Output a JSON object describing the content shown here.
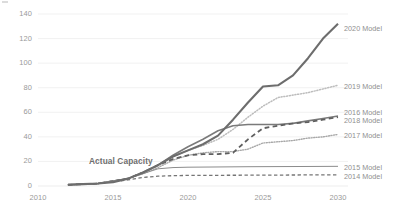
{
  "chart_data": {
    "type": "line",
    "title": "",
    "subtitle": "",
    "xlabel": "",
    "ylabel": "",
    "xlim": [
      2010,
      2030
    ],
    "ylim": [
      0,
      140
    ],
    "grid": true,
    "grid_orientation": "horizontal",
    "legend_position": "right-inline-end-of-line",
    "x_ticks": [
      "2010",
      "2015",
      "2020",
      "2025",
      "2030"
    ],
    "y_ticks": [
      "0",
      "20",
      "40",
      "60",
      "80",
      "100",
      "120",
      "140"
    ],
    "annotations": [
      {
        "text": "Actual Capacity",
        "x": 2015.6,
        "y": 20,
        "bold": true
      }
    ],
    "series": [
      {
        "name": "2020 Model",
        "label": "2020 Model",
        "color": "#6d6d6d",
        "style": "solid",
        "width": 2.1,
        "legend_y_value": 128,
        "x": [
          2012,
          2013,
          2014,
          2015,
          2016,
          2017,
          2018,
          2019,
          2020,
          2021,
          2022,
          2023,
          2024,
          2025,
          2026,
          2027,
          2028,
          2029,
          2030
        ],
        "values": [
          1,
          1.5,
          2,
          3,
          6,
          11,
          17,
          24,
          29,
          34,
          41,
          54,
          68,
          81,
          82,
          90,
          104,
          120,
          132
        ]
      },
      {
        "name": "2019 Model",
        "label": "2019 Model",
        "color": "#bdbdbd",
        "style": "dotted",
        "width": 1.5,
        "legend_y_value": 81,
        "x": [
          2012,
          2014,
          2016,
          2017,
          2018,
          2019,
          2020,
          2021,
          2022,
          2023,
          2024,
          2025,
          2026,
          2027,
          2028,
          2029,
          2030
        ],
        "values": [
          1,
          2,
          6,
          11,
          17,
          24,
          29,
          33,
          38,
          46,
          56,
          65,
          72,
          74,
          76,
          79,
          82
        ]
      },
      {
        "name": "2016 Model",
        "label": "2016 Model",
        "color": "#7a7a7a",
        "style": "solid",
        "width": 1.6,
        "legend_y_value": 60,
        "x": [
          2012,
          2014,
          2016,
          2017,
          2018,
          2019,
          2020,
          2021,
          2022,
          2023,
          2024,
          2025,
          2026,
          2027,
          2028,
          2029,
          2030
        ],
        "values": [
          1,
          2,
          6,
          11,
          17,
          25,
          32,
          38,
          45,
          49,
          50,
          50,
          50,
          51,
          53,
          55,
          57
        ]
      },
      {
        "name": "2018 Model",
        "label": "2018 Model",
        "color": "#5f5f5f",
        "style": "dashed",
        "width": 1.8,
        "legend_y_value": 53,
        "x": [
          2012,
          2014,
          2016,
          2017,
          2018,
          2019,
          2020,
          2021,
          2022,
          2023,
          2024,
          2025,
          2026,
          2027,
          2028,
          2029,
          2030
        ],
        "values": [
          1,
          2,
          6,
          11,
          17,
          22,
          25,
          26,
          26,
          27,
          38,
          47,
          49,
          51,
          52,
          54,
          56
        ]
      },
      {
        "name": "2017 Model",
        "label": "2017 Model",
        "color": "#a8a8a8",
        "style": "dotted",
        "width": 1.4,
        "legend_y_value": 41,
        "x": [
          2012,
          2014,
          2016,
          2017,
          2018,
          2019,
          2020,
          2021,
          2022,
          2023,
          2024,
          2025,
          2026,
          2027,
          2028,
          2029,
          2030
        ],
        "values": [
          1,
          2,
          6,
          10,
          15,
          21,
          25,
          27,
          28,
          28,
          30,
          35,
          36,
          37,
          39,
          40,
          42
        ]
      },
      {
        "name": "2015 Model",
        "label": "2015 Model",
        "color": "#8c8c8c",
        "style": "solid",
        "width": 1.0,
        "legend_y_value": 15,
        "x": [
          2012,
          2014,
          2016,
          2017,
          2018,
          2019,
          2020,
          2022,
          2024,
          2026,
          2028,
          2030
        ],
        "values": [
          1,
          2,
          6,
          10,
          14,
          15,
          15.3,
          15.5,
          15.7,
          15.8,
          15.9,
          16
        ]
      },
      {
        "name": "2014 Model",
        "label": "2014 Model",
        "color": "#757575",
        "style": "dashed",
        "width": 1.3,
        "legend_y_value": 8,
        "x": [
          2012,
          2014,
          2016,
          2017,
          2018,
          2019,
          2020,
          2022,
          2024,
          2026,
          2028,
          2030
        ],
        "values": [
          1,
          2,
          5,
          7,
          8,
          8.4,
          8.6,
          8.7,
          8.8,
          8.9,
          9,
          9
        ]
      }
    ]
  },
  "geometry": {
    "plot_left": 38,
    "plot_right": 338,
    "plot_top": 14,
    "plot_bottom": 186,
    "x_min": 2010,
    "x_max": 2030,
    "y_min": 0,
    "y_max": 140
  },
  "style": {
    "grid_color": "#ededed",
    "tick_color": "#9a9a9a",
    "background": "#ffffff"
  }
}
